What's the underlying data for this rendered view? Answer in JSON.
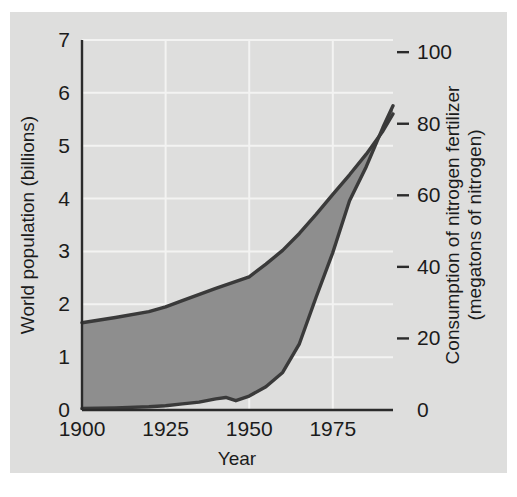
{
  "figure": {
    "background_color": "#dededd",
    "page_color": "#ffffff",
    "band_fill_color": "#8e8e8e",
    "curve_color": "#3a3a3a",
    "gridline_color": "#f3f3f2",
    "axis_color": "#2b2b2b"
  },
  "chart_data": {
    "type": "area",
    "title": "",
    "subtitle": "",
    "xlabel": "Year",
    "ylabel": "World population (billions)",
    "y2label": "Consumption of nitrogen fertilizer (megatons of nitrogen)",
    "y2label_line1": "Consumption of nitrogen fertilizer",
    "y2label_line2": "(megatons of nitrogen)",
    "grid": true,
    "legend": "none",
    "xlim": [
      1900,
      1993
    ],
    "ylim": [
      0,
      7
    ],
    "y2lim": [
      0,
      103.4
    ],
    "xticks": [
      1900,
      1925,
      1950,
      1975
    ],
    "xtick_labels": [
      "1900",
      "1925",
      "1950",
      "1975"
    ],
    "yticks": [
      0,
      1,
      2,
      3,
      4,
      5,
      6,
      7
    ],
    "ytick_labels": [
      "0",
      "1",
      "2",
      "3",
      "4",
      "5",
      "6",
      "7"
    ],
    "y2ticks": [
      0,
      20,
      40,
      60,
      80,
      100
    ],
    "y2tick_labels": [
      "0",
      "20",
      "40",
      "60",
      "80",
      "100"
    ],
    "gridlines_x": [
      1925,
      1950,
      1975
    ],
    "gridlines_y": [
      1,
      2,
      3,
      4,
      5,
      6,
      7
    ],
    "series": [
      {
        "name": "World population",
        "axis": "left",
        "units": "billions",
        "x": [
          1900,
          1910,
          1920,
          1925,
          1930,
          1940,
          1950,
          1955,
          1960,
          1965,
          1970,
          1975,
          1980,
          1985,
          1990,
          1993
        ],
        "values": [
          1.65,
          1.75,
          1.86,
          1.95,
          2.07,
          2.3,
          2.52,
          2.76,
          3.02,
          3.34,
          3.7,
          4.08,
          4.45,
          4.84,
          5.28,
          5.6
        ]
      },
      {
        "name": "Consumption of nitrogen fertilizer",
        "axis": "right",
        "units": "megatons of nitrogen",
        "x": [
          1900,
          1910,
          1920,
          1925,
          1930,
          1935,
          1940,
          1943,
          1946,
          1950,
          1955,
          1960,
          1965,
          1970,
          1975,
          1980,
          1985,
          1990,
          1993
        ],
        "values": [
          0.4,
          0.6,
          0.9,
          1.2,
          1.7,
          2.2,
          3.1,
          3.5,
          2.6,
          3.9,
          6.5,
          10.5,
          18.5,
          31.5,
          44.0,
          58.5,
          68.0,
          79.0,
          85.0
        ]
      }
    ],
    "annotations": []
  }
}
